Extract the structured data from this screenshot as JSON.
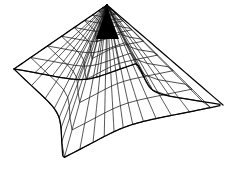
{
  "figure": {
    "background_color": "#ffffff",
    "line_color": "#000000",
    "width_px": 227,
    "height_px": 169
  },
  "chart_data": {
    "type": "line",
    "subtitle": "",
    "xlabel": "",
    "ylabel": "",
    "grid": true,
    "legend_position": "none",
    "projection": "3d-wireframe",
    "surface": {
      "name": "tent-surface",
      "apex": {
        "x": 107,
        "y": 5
      },
      "corners": [
        {
          "name": "left-cusp",
          "x": 14,
          "y": 69
        },
        {
          "name": "bottom-cusp",
          "x": 63,
          "y": 158
        },
        {
          "name": "right-cusp",
          "x": 223,
          "y": 105
        },
        {
          "name": "top-cusp",
          "x": 107,
          "y": 5
        }
      ],
      "radial_lines": 32,
      "rings": 10,
      "ring_fractions": [
        0.06,
        0.13,
        0.21,
        0.3,
        0.4,
        0.51,
        0.63,
        0.75,
        0.88,
        1.0
      ]
    }
  },
  "elements": {
    "canvas_label": "wireframe-canvas",
    "apex_label": "surface-apex",
    "boundary_label": "surface-boundary"
  }
}
